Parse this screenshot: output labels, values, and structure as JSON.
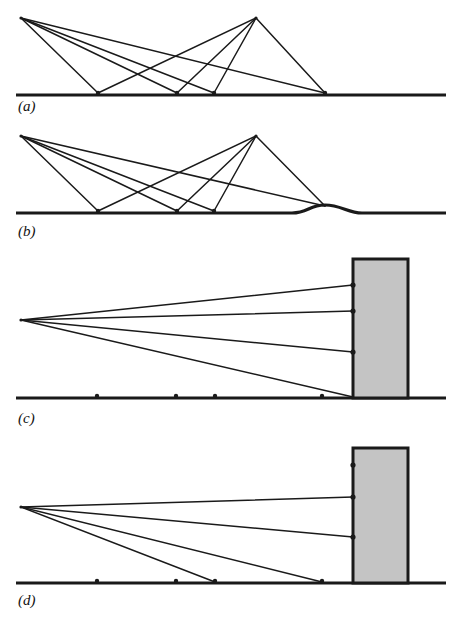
{
  "figure": {
    "type": "diagram",
    "width": 462,
    "height": 617,
    "background_color": "#ffffff",
    "line_color": "#1a1a1a",
    "ground_color": "#1a1a1a",
    "block_fill_color": "#c4c4c4",
    "block_stroke_color": "#1a1a1a",
    "ground_stroke_width": 3.2,
    "ray_stroke_width": 1.5,
    "block_stroke_width": 3.0
  },
  "panels": [
    {
      "id": "a",
      "label": "(a)",
      "label_x": 18,
      "label_y": 111,
      "description": "two apex sources with crossing rays onto flat ground",
      "ground": {
        "x1": 16,
        "x2": 446,
        "y": 95,
        "flat": true
      },
      "apexes": [
        {
          "name": "left-apex",
          "x": 21,
          "y": 18
        },
        {
          "name": "right-apex",
          "x": 256,
          "y": 18
        }
      ],
      "ground_nodes": [
        98,
        177,
        214,
        325
      ],
      "rays": [
        {
          "from": [
            21,
            18
          ],
          "to": [
            98,
            93
          ]
        },
        {
          "from": [
            21,
            18
          ],
          "to": [
            177,
            93
          ]
        },
        {
          "from": [
            21,
            18
          ],
          "to": [
            214,
            93
          ]
        },
        {
          "from": [
            21,
            18
          ],
          "to": [
            325,
            93
          ]
        },
        {
          "from": [
            256,
            18
          ],
          "to": [
            98,
            93
          ]
        },
        {
          "from": [
            256,
            18
          ],
          "to": [
            177,
            93
          ]
        },
        {
          "from": [
            256,
            18
          ],
          "to": [
            214,
            93
          ]
        },
        {
          "from": [
            256,
            18
          ],
          "to": [
            325,
            93
          ]
        }
      ],
      "block": null,
      "bump": null
    },
    {
      "id": "b",
      "label": "(b)",
      "label_x": 18,
      "label_y": 236,
      "description": "same ray geometry as (a) but ground has a raised bump at right",
      "ground": {
        "x1": 16,
        "x2": 446,
        "y": 213,
        "flat": false
      },
      "apexes": [
        {
          "name": "left-apex",
          "x": 21,
          "y": 136
        },
        {
          "name": "right-apex",
          "x": 256,
          "y": 136
        }
      ],
      "ground_nodes": [
        98,
        177,
        214
      ],
      "rays": [
        {
          "from": [
            21,
            136
          ],
          "to": [
            98,
            211
          ]
        },
        {
          "from": [
            21,
            136
          ],
          "to": [
            177,
            211
          ]
        },
        {
          "from": [
            21,
            136
          ],
          "to": [
            214,
            211
          ]
        },
        {
          "from": [
            21,
            136
          ],
          "to": [
            325,
            206
          ]
        },
        {
          "from": [
            256,
            136
          ],
          "to": [
            98,
            211
          ]
        },
        {
          "from": [
            256,
            136
          ],
          "to": [
            177,
            211
          ]
        },
        {
          "from": [
            256,
            136
          ],
          "to": [
            214,
            211
          ]
        },
        {
          "from": [
            256,
            136
          ],
          "to": [
            325,
            206
          ]
        }
      ],
      "bump": {
        "start_x": 292,
        "crest_x": 325,
        "crest_y": 205,
        "end_x": 362,
        "base_y": 213
      },
      "block": null
    },
    {
      "id": "c",
      "label": "(c)",
      "label_x": 18,
      "label_y": 423,
      "description": "single source with four rays reaching a tall grey block, all rays clear the ground",
      "ground": {
        "x1": 16,
        "x2": 446,
        "y": 398,
        "flat": true
      },
      "apexes": [
        {
          "name": "source-apex",
          "x": 21,
          "y": 320
        }
      ],
      "ground_nodes": [
        97,
        176,
        215,
        322
      ],
      "rays": [
        {
          "from": [
            21,
            320
          ],
          "to": [
            353,
            285
          ]
        },
        {
          "from": [
            21,
            320
          ],
          "to": [
            353,
            311
          ]
        },
        {
          "from": [
            21,
            320
          ],
          "to": [
            353,
            352
          ]
        },
        {
          "from": [
            21,
            320
          ],
          "to": [
            353,
            397
          ]
        }
      ],
      "ray_endpoint_dots": [
        [
          353,
          285
        ],
        [
          353,
          311
        ],
        [
          353,
          352
        ]
      ],
      "block": {
        "x": 353,
        "y": 259,
        "width": 55,
        "height": 139
      },
      "bump": null
    },
    {
      "id": "d",
      "label": "(d)",
      "label_x": 18,
      "label_y": 605,
      "description": "single source where only the upper rays reach the block and the lower rays terminate on the ground",
      "ground": {
        "x1": 16,
        "x2": 446,
        "y": 583,
        "flat": true
      },
      "apexes": [
        {
          "name": "source-apex",
          "x": 21,
          "y": 507
        }
      ],
      "ground_nodes": [
        97,
        176,
        215,
        322
      ],
      "rays": [
        {
          "from": [
            21,
            507
          ],
          "to": [
            353,
            497
          ]
        },
        {
          "from": [
            21,
            507
          ],
          "to": [
            353,
            537
          ]
        },
        {
          "from": [
            21,
            507
          ],
          "to": [
            215,
            582
          ]
        },
        {
          "from": [
            21,
            507
          ],
          "to": [
            322,
            582
          ]
        }
      ],
      "ray_endpoint_dots": [
        [
          353,
          465
        ],
        [
          353,
          497
        ],
        [
          353,
          537
        ]
      ],
      "block": {
        "x": 353,
        "y": 448,
        "width": 55,
        "height": 135
      },
      "bump": null
    }
  ]
}
